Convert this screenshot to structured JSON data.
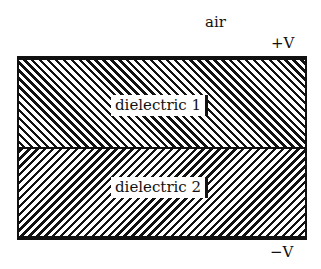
{
  "diagram": {
    "region_above_label": "air",
    "top_plate_label": "+V",
    "bottom_plate_label": "−V",
    "layers": [
      {
        "label": "dielectric 1",
        "hatch": "diagonal-backslash"
      },
      {
        "label": "dielectric 2",
        "hatch": "diagonal-slash"
      }
    ],
    "colors": {
      "ink": "#111111",
      "background": "#ffffff"
    }
  }
}
